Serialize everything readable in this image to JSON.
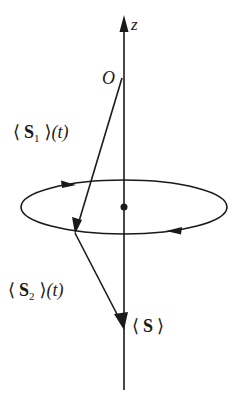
{
  "diagram": {
    "type": "vector-precession",
    "axis": {
      "label": "z"
    },
    "origin": {
      "label": "O"
    },
    "vectors": [
      {
        "id": "s1",
        "label_open": "⟨",
        "symbol": "S",
        "subscript": "1",
        "label_close": "⟩",
        "arg": "(t)"
      },
      {
        "id": "s2",
        "label_open": "⟨",
        "symbol": "S",
        "subscript": "2",
        "label_close": "⟩",
        "arg": "(t)"
      },
      {
        "id": "s_total",
        "label_open": "⟨",
        "symbol": "S",
        "label_close": "⟩"
      }
    ],
    "precession_direction": "counterclockwise-viewed-from-above",
    "colors": {
      "stroke": "#1a1a1a",
      "background": "#ffffff"
    }
  }
}
